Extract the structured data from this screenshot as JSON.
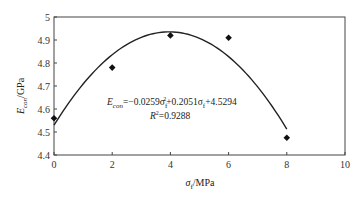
{
  "chart_data": {
    "type": "scatter",
    "title": "",
    "xlabel": "σf/MPa",
    "ylabel": "Econ/GPa",
    "xlim": [
      0,
      10
    ],
    "ylim": [
      4.4,
      5.0
    ],
    "x_ticks": [
      "0",
      "2",
      "4",
      "6",
      "8",
      "10"
    ],
    "y_ticks": [
      "4.4",
      "4.5",
      "4.6",
      "4.7",
      "4.8",
      "4.9",
      "5"
    ],
    "grid": false,
    "legend": null,
    "series": [
      {
        "name": "measured",
        "marker": "diamond",
        "x": [
          0,
          2,
          4,
          6,
          8
        ],
        "y": [
          4.56,
          4.78,
          4.92,
          4.91,
          4.475
        ]
      },
      {
        "name": "quadratic fit",
        "type": "line",
        "equation": "Econ=-0.0259σf²+0.2051σf+4.5294",
        "coefficients": {
          "a": -0.0259,
          "b": 0.2051,
          "c": 4.5294
        },
        "x_range": [
          0,
          8
        ]
      }
    ],
    "annotations": {
      "equation": "Econ=−0.0259σf²+0.2051σf+4.5294",
      "r_squared": "R²=0.9288"
    }
  },
  "labels": {
    "y_main": "E",
    "y_sub": "con",
    "y_unit": "/GPa",
    "x_main": "σ",
    "x_sub": "f",
    "x_unit": "/MPa",
    "eq_e": "E",
    "eq_sub": "con",
    "eq_part1": "=−0.0259σ",
    "eq_sub_f1": "f",
    "eq_sup2": "2",
    "eq_part2": "+0.2051σ",
    "eq_sub_f2": "f",
    "eq_part3": "+4.5294",
    "r2_r": "R",
    "r2_sup": "2",
    "r2_val": "=0.9288"
  }
}
